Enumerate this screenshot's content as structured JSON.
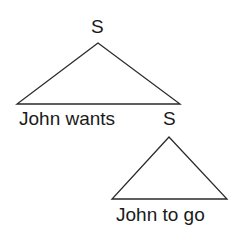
{
  "tree": {
    "root": {
      "label": "S",
      "leaves": "John wants",
      "embedded": {
        "label": "S",
        "leaves": "John to go"
      }
    }
  },
  "colors": {
    "line": "#2a2a2a",
    "text": "#1a1a1a",
    "background": "#ffffff"
  }
}
